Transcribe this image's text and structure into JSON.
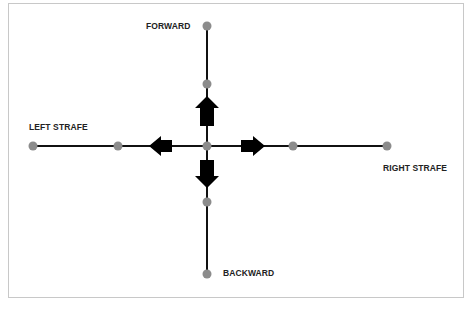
{
  "diagram": {
    "labels": {
      "forward": "FORWARD",
      "backward": "BACKWARD",
      "left": "LEFT STRAFE",
      "right": "RIGHT STRAFE"
    },
    "colors": {
      "line": "#111111",
      "node": "#8c8c8c",
      "arrow": "#000000",
      "frame": "#c8c8c8"
    },
    "center": [
      207,
      146
    ],
    "nodes": [
      {
        "id": "forward-end",
        "x": 207,
        "y": 26
      },
      {
        "id": "forward-mid",
        "x": 207,
        "y": 84
      },
      {
        "id": "center",
        "x": 207,
        "y": 146
      },
      {
        "id": "backward-mid",
        "x": 207,
        "y": 202
      },
      {
        "id": "backward-end",
        "x": 207,
        "y": 274
      },
      {
        "id": "left-end",
        "x": 33,
        "y": 146
      },
      {
        "id": "left-mid",
        "x": 118,
        "y": 146
      },
      {
        "id": "right-mid",
        "x": 293,
        "y": 146
      },
      {
        "id": "right-end",
        "x": 387,
        "y": 146
      }
    ],
    "arrows": [
      "up",
      "down",
      "left",
      "right"
    ]
  }
}
